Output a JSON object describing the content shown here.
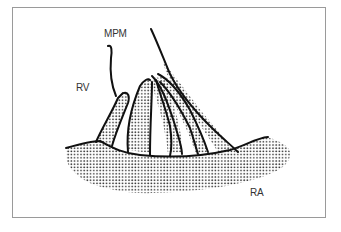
{
  "diagram": {
    "labels": {
      "mpm": "MPM",
      "rv": "RV",
      "ra": "RA"
    },
    "colors": {
      "frame": "#9a9a9a",
      "ink": "#111111",
      "stipple": "#333333",
      "text": "#333333"
    }
  }
}
